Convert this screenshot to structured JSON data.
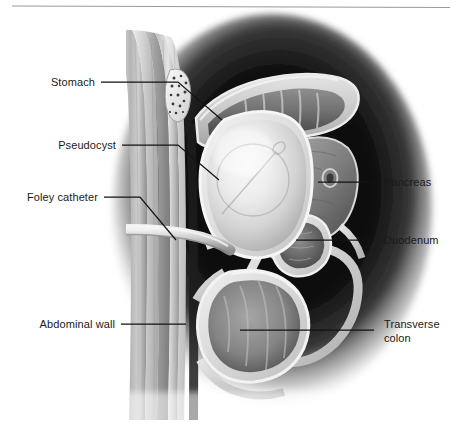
{
  "figure": {
    "orientation": "sagittal cross-section",
    "style": "grayscale medical illustration",
    "background_color": "#ffffff",
    "ink_color": "#121212",
    "label_color": "#1a1a1a",
    "halo_color": "#0a0a0a",
    "tissue_light": "#e8e8e8",
    "tissue_mid": "#9a9a9a",
    "tissue_dark": "#4a4a4a"
  },
  "header": {
    "rule_visible": "true"
  },
  "labels": {
    "left": [
      {
        "id": "stomach",
        "text": "Stomach"
      },
      {
        "id": "pseudocyst",
        "text": "Pseudocyst"
      },
      {
        "id": "foley-catheter",
        "text": "Foley catheter"
      },
      {
        "id": "abdominal-wall",
        "text": "Abdominal wall"
      }
    ],
    "right": [
      {
        "id": "pancreas",
        "text": "Pancreas"
      },
      {
        "id": "duodenum",
        "text": "Duodenum"
      },
      {
        "id": "transverse-colon",
        "text": "Transverse",
        "text2": "colon"
      }
    ]
  },
  "structures": [
    {
      "id": "abdominal-wall",
      "name": "Abdominal wall"
    },
    {
      "id": "umbilicus",
      "name": "Umbilicus fatty tissue"
    },
    {
      "id": "stomach",
      "name": "Stomach"
    },
    {
      "id": "pseudocyst",
      "name": "Pseudocyst"
    },
    {
      "id": "balloon",
      "name": "Foley balloon"
    },
    {
      "id": "catheter",
      "name": "Foley catheter tube"
    },
    {
      "id": "pancreas",
      "name": "Pancreas"
    },
    {
      "id": "duodenum",
      "name": "Duodenum"
    },
    {
      "id": "transverse-colon",
      "name": "Transverse colon"
    }
  ]
}
